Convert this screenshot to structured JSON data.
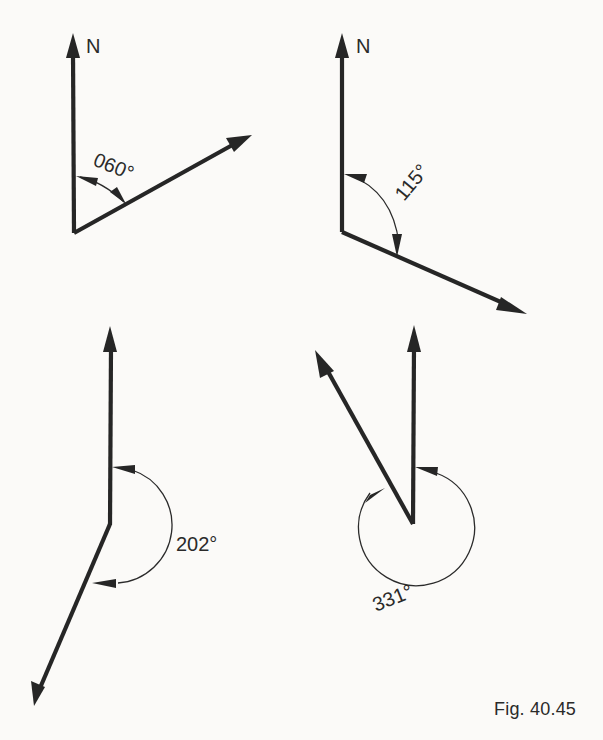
{
  "figure": {
    "caption": "Fig. 40.45",
    "background": "#fbfaf8",
    "ink_color": "#262626"
  },
  "diagrams": [
    {
      "id": "bearing-060",
      "north_label": "N",
      "bearing_label": "060°",
      "bearing_deg": 60,
      "vertex": [
        74,
        233
      ],
      "north_tip": [
        73,
        33
      ],
      "bearing_tip": [
        252,
        135
      ]
    },
    {
      "id": "bearing-115",
      "north_label": "N",
      "bearing_label": "115°",
      "bearing_deg": 115,
      "vertex": [
        342,
        232
      ],
      "north_tip": [
        342,
        33
      ],
      "bearing_tip": [
        527,
        314
      ]
    },
    {
      "id": "bearing-202",
      "north_label": "",
      "bearing_label": "202°",
      "bearing_deg": 202,
      "vertex": [
        110,
        524
      ],
      "north_tip": [
        110,
        326
      ],
      "bearing_tip": [
        34,
        706
      ]
    },
    {
      "id": "bearing-331",
      "north_label": "",
      "bearing_label": "331°",
      "bearing_deg": 331,
      "vertex": [
        413,
        524
      ],
      "north_tip": [
        414,
        325
      ],
      "bearing_tip": [
        315,
        350
      ]
    }
  ]
}
